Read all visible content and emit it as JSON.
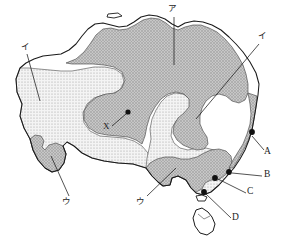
{
  "figure": {
    "region": "Australia",
    "background_color": "#ffffff",
    "outline_color": "#1a1a1a"
  },
  "legend_zones": [
    {
      "key": "stipple_light",
      "name": "light-stipple-zone",
      "fill": "#efefef",
      "dot": "#9a9a9a",
      "description": "arid interior / desert zone"
    },
    {
      "key": "gray_mid",
      "name": "gray-stipple-zone",
      "fill": "#b8b8b8",
      "dot": "#8c8c8c",
      "description": "semi-arid grassland / savanna belt"
    },
    {
      "key": "white",
      "name": "unshaded-zone",
      "fill": "#ffffff",
      "dot": "#ffffff",
      "description": "humid / temperate zone"
    }
  ],
  "zone_labels": [
    {
      "id": "a",
      "text": "ア",
      "x": 170,
      "y": 6,
      "leader": {
        "x1": 174,
        "y1": 17,
        "x2": 174,
        "y2": 65
      }
    },
    {
      "id": "i_left",
      "text": "イ",
      "x": 22,
      "y": 44,
      "leader": {
        "x1": 27,
        "y1": 54,
        "x2": 40,
        "y2": 101
      }
    },
    {
      "id": "i_right",
      "text": "イ",
      "x": 261,
      "y": 33,
      "leader": {
        "x1": 260,
        "y1": 44,
        "x2": 196,
        "y2": 119
      }
    },
    {
      "id": "u_left",
      "text": "ウ",
      "x": 63,
      "y": 198,
      "leader": {
        "x1": 68,
        "y1": 198,
        "x2": 51,
        "y2": 156
      }
    },
    {
      "id": "u_mid",
      "text": "ウ",
      "x": 137,
      "y": 198,
      "leader": {
        "x1": 146,
        "y1": 197,
        "x2": 175,
        "y2": 168
      }
    }
  ],
  "point_markers": [
    {
      "id": "X",
      "label": "X",
      "label_x": 104,
      "label_y": 126,
      "dot_x": 128,
      "dot_y": 112,
      "leader": {
        "x1": 112,
        "y1": 126,
        "x2": 126,
        "y2": 114
      }
    },
    {
      "id": "A",
      "label": "A",
      "label_x": 265,
      "label_y": 152,
      "dot_x": 252,
      "dot_y": 132,
      "leader": {
        "x1": 264,
        "y1": 151,
        "x2": 251,
        "y2": 135
      }
    },
    {
      "id": "B",
      "label": "B",
      "label_x": 265,
      "label_y": 174,
      "dot_x": 229,
      "dot_y": 172,
      "leader": {
        "x1": 263,
        "y1": 177,
        "x2": 232,
        "y2": 173
      }
    },
    {
      "id": "C",
      "label": "C",
      "label_x": 248,
      "label_y": 191,
      "dot_x": 216,
      "dot_y": 178,
      "leader": {
        "x1": 247,
        "y1": 194,
        "x2": 218,
        "y2": 179
      }
    },
    {
      "id": "D",
      "label": "D",
      "label_x": 233,
      "label_y": 217,
      "dot_x": 204,
      "dot_y": 192,
      "leader": {
        "x1": 232,
        "y1": 219,
        "x2": 206,
        "y2": 194
      }
    }
  ],
  "islands": [
    {
      "name": "tasmania",
      "shaded": false
    },
    {
      "name": "kangaroo-island",
      "shaded": false
    },
    {
      "name": "melville-island",
      "shaded": false
    }
  ]
}
